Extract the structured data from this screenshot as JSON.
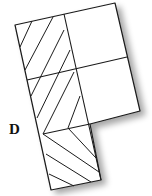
{
  "diagram": {
    "type": "rotated-grid-shape",
    "stroke_color": "#1a1a1a",
    "background": "#ffffff",
    "label": {
      "text": "D",
      "x": 10,
      "y": 123
    },
    "regions": [
      {
        "name": "left-column-upper-hatched",
        "hatch": "diagonal-up"
      },
      {
        "name": "left-column-lower-hatched",
        "hatch": "diagonal-down"
      },
      {
        "name": "right-top-square",
        "hatch": "none"
      },
      {
        "name": "right-middle-square",
        "hatch": "none"
      }
    ]
  }
}
